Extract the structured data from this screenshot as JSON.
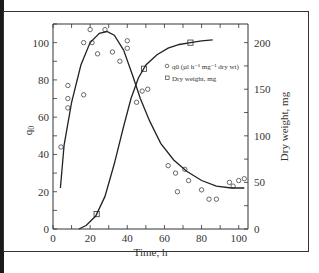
{
  "chart_data": {
    "type": "scatter",
    "title": "",
    "xlabel": "Time, h",
    "ylabel": "q0",
    "ylabel_right": "Dry weight, mg",
    "xlim": [
      0,
      105
    ],
    "ylim": [
      0,
      110
    ],
    "ylim_right": [
      0,
      220
    ],
    "x_ticks": [
      0,
      20,
      40,
      60,
      80,
      100
    ],
    "y_ticks": [
      0,
      20,
      40,
      60,
      80,
      100
    ],
    "y_right_ticks": [
      0,
      50,
      100,
      150,
      200
    ],
    "grid": false,
    "legend_position": "upper right (inside)",
    "legend": [
      {
        "marker": "circle",
        "label": "q0 (µl h⁻¹ mg⁻¹ dry wt)"
      },
      {
        "marker": "square",
        "label": "Dry weight, mg"
      }
    ],
    "series": [
      {
        "name": "q0 (µl h⁻¹ mg⁻¹ dry wt)",
        "axis": "left",
        "marker": "circle",
        "points": [
          [
            4.3,
            44
          ],
          [
            8,
            77
          ],
          [
            8,
            70
          ],
          [
            8,
            65
          ],
          [
            16.5,
            100
          ],
          [
            16.5,
            72
          ],
          [
            20,
            107
          ],
          [
            21,
            100
          ],
          [
            24,
            94
          ],
          [
            28,
            107
          ],
          [
            32,
            95
          ],
          [
            36,
            90
          ],
          [
            40,
            101
          ],
          [
            40,
            97
          ],
          [
            45,
            68
          ],
          [
            48,
            74
          ],
          [
            51,
            75
          ],
          [
            62,
            34
          ],
          [
            66,
            30
          ],
          [
            67,
            20
          ],
          [
            71,
            32
          ],
          [
            73,
            26
          ],
          [
            80,
            21
          ],
          [
            84,
            16
          ],
          [
            88,
            16
          ],
          [
            95,
            25
          ],
          [
            97,
            23
          ],
          [
            100,
            26
          ],
          [
            103,
            27
          ]
        ]
      },
      {
        "name": "q0 fitted curve",
        "axis": "left",
        "type": "line",
        "points": [
          [
            4,
            22
          ],
          [
            6,
            45
          ],
          [
            10,
            68
          ],
          [
            15,
            88
          ],
          [
            20,
            100
          ],
          [
            25,
            105
          ],
          [
            29,
            106
          ],
          [
            33,
            104
          ],
          [
            38,
            96
          ],
          [
            43,
            82
          ],
          [
            47,
            70
          ],
          [
            52,
            58
          ],
          [
            58,
            46
          ],
          [
            65,
            37
          ],
          [
            72,
            31
          ],
          [
            80,
            26
          ],
          [
            88,
            23
          ],
          [
            96,
            22
          ],
          [
            103,
            22
          ]
        ]
      },
      {
        "name": "Dry weight, mg",
        "axis": "right",
        "marker": "square",
        "points": [
          [
            23.5,
            16
          ],
          [
            49,
            172
          ],
          [
            74,
            200
          ]
        ]
      },
      {
        "name": "Dry weight fitted curve",
        "axis": "right",
        "type": "line",
        "points": [
          [
            14,
            0
          ],
          [
            18,
            4
          ],
          [
            23,
            14
          ],
          [
            28,
            35
          ],
          [
            33,
            70
          ],
          [
            38,
            110
          ],
          [
            42,
            140
          ],
          [
            46,
            162
          ],
          [
            50,
            176
          ],
          [
            56,
            187
          ],
          [
            62,
            194
          ],
          [
            68,
            198
          ],
          [
            74,
            200
          ],
          [
            80,
            202
          ],
          [
            86,
            203
          ]
        ]
      }
    ]
  },
  "labels": {
    "xlabel": "Time, h",
    "ylabel_left": "q0",
    "ylabel_left_sub": "0",
    "ylabel_right": "Dry weight, mg",
    "legend_circle": "q0 (µl h⁻¹ mg⁻¹ dry wt)",
    "legend_square": "Dry weight, mg"
  }
}
